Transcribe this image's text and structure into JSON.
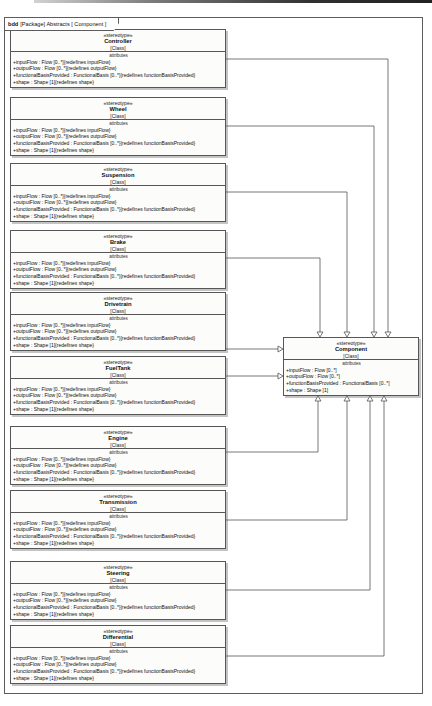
{
  "frame": {
    "keyword": "bdd",
    "title": "[Package] Abstracts [ Component ]"
  },
  "classes": [
    {
      "stereotype": "«stereotype»",
      "name": "Controller",
      "classifier": "[Class]",
      "attributes_label": "attributes",
      "attributes": [
        "+inputFlow : Flow [0..*]{redefines inputFlow}",
        "+outputFlow : Flow [0..*]{redefines outputFlow}",
        "+functionalBasisProvided : FunctionalBasis [0..*]{redefines functionBasisProvided}",
        "+shape : Shape [1]{redefines shape}"
      ]
    },
    {
      "stereotype": "«stereotype»",
      "name": "Wheel",
      "classifier": "[Class]",
      "attributes_label": "attributes",
      "attributes": [
        "+inputFlow : Flow [0..*]{redefines inputFlow}",
        "+outputFlow : Flow [0..*]{redefines outputFlow}",
        "+functionalBasisProvided : FunctionalBasis [0..*]{redefines functionBasisProvided}",
        "+shape : Shape [1]{redefines shape}"
      ]
    },
    {
      "stereotype": "«stereotype»",
      "name": "Suspension",
      "classifier": "[Class]",
      "attributes_label": "attributes",
      "attributes": [
        "+inputFlow : Flow [0..*]{redefines inputFlow}",
        "+outputFlow : Flow [0..*]{redefines outputFlow}",
        "+functionalBasisProvided : FunctionalBasis [0..*]{redefines functionBasisProvided}",
        "+shape : Shape [1]{redefines shape}"
      ]
    },
    {
      "stereotype": "«stereotype»",
      "name": "Brake",
      "classifier": "[Class]",
      "attributes_label": "attributes",
      "attributes": [
        "+inputFlow : Flow [0..*]{redefines inputFlow}",
        "+outputFlow : Flow [0..*]{redefines outputFlow}",
        "+functionalBasisProvided : FunctionalBasis [0..*]{redefines functionBasisProvided}",
        "+shape : Shape [1]{redefines shape}"
      ]
    },
    {
      "stereotype": "«stereotype»",
      "name": "Drivetrain",
      "classifier": "[Class]",
      "attributes_label": "attributes",
      "attributes": [
        "+inputFlow : Flow [0..*]{redefines inputFlow}",
        "+outputFlow : Flow [0..*]{redefines outputFlow}",
        "+functionalBasisProvided : FunctionalBasis [0..*]{redefines functionBasisProvided}",
        "+shape : Shape [1]{redefines shape}"
      ]
    },
    {
      "stereotype": "«stereotype»",
      "name": "FuelTank",
      "classifier": "[Class]",
      "attributes_label": "attributes",
      "attributes": [
        "+inputFlow : Flow [0..*]{redefines inputFlow}",
        "+outputFlow : Flow [0..*]{redefines outputFlow}",
        "+functionalBasisProvided : FunctionalBasis [0..*]{redefines functionBasisProvided}",
        "+shape : Shape [1]{redefines shape}"
      ]
    },
    {
      "stereotype": "«stereotype»",
      "name": "Engine",
      "classifier": "[Class]",
      "attributes_label": "attributes",
      "attributes": [
        "+inputFlow : Flow [0..*]{redefines inputFlow}",
        "+outputFlow : Flow [0..*]{redefines outputFlow}",
        "+functionalBasisProvided : FunctionalBasis [0..*]{redefines functionBasisProvided}",
        "+shape : Shape [1]{redefines shape}"
      ]
    },
    {
      "stereotype": "«stereotype»",
      "name": "Transmission",
      "classifier": "[Class]",
      "attributes_label": "attributes",
      "attributes": [
        "+inputFlow : Flow [0..*]{redefines inputFlow}",
        "+outputFlow : Flow [0..*]{redefines outputFlow}",
        "+functionalBasisProvided : FunctionalBasis [0..*]{redefines functionBasisProvided}",
        "+shape : Shape [1]{redefines shape}"
      ]
    },
    {
      "stereotype": "«stereotype»",
      "name": "Steering",
      "classifier": "[Class]",
      "attributes_label": "attributes",
      "attributes": [
        "+inputFlow : Flow [0..*]{redefines inputFlow}",
        "+outputFlow : Flow [0..*]{redefines outputFlow}",
        "+functionalBasisProvided : FunctionalBasis [0..*]{redefines functionBasisProvided}",
        "+shape : Shape [1]{redefines shape}"
      ]
    },
    {
      "stereotype": "«stereotype»",
      "name": "Differential",
      "classifier": "[Class]",
      "attributes_label": "attributes",
      "attributes": [
        "+inputFlow : Flow [0..*]{redefines inputFlow}",
        "+outputFlow : Flow [0..*]{redefines outputFlow}",
        "+functionalBasisProvided : FunctionalBasis [0..*]{redefines functionBasisProvided}",
        "+shape : Shape [1]{redefines shape}"
      ]
    }
  ],
  "component": {
    "stereotype": "«stereotype»",
    "name": "Component",
    "classifier": "[Class]",
    "attributes_label": "attributes",
    "attributes": [
      "+inputFlow : Flow [0..*]",
      "+outputFlow : Flow [0..*]",
      "+functionBasisProvided : FunctionalBasis [0..*]",
      "+shape : Shape [1]"
    ]
  },
  "relationships": [
    {
      "from": "Controller",
      "to": "Component",
      "type": "generalization"
    },
    {
      "from": "Wheel",
      "to": "Component",
      "type": "generalization"
    },
    {
      "from": "Suspension",
      "to": "Component",
      "type": "generalization"
    },
    {
      "from": "Brake",
      "to": "Component",
      "type": "generalization"
    },
    {
      "from": "Drivetrain",
      "to": "Component",
      "type": "generalization"
    },
    {
      "from": "FuelTank",
      "to": "Component",
      "type": "generalization"
    },
    {
      "from": "Engine",
      "to": "Component",
      "type": "generalization"
    },
    {
      "from": "Transmission",
      "to": "Component",
      "type": "generalization"
    },
    {
      "from": "Steering",
      "to": "Component",
      "type": "generalization"
    },
    {
      "from": "Differential",
      "to": "Component",
      "type": "generalization"
    }
  ],
  "colors": {
    "box_border": "#565656",
    "box_fill": "#fcfcfa",
    "edge": "#555555",
    "text": "#101010"
  }
}
